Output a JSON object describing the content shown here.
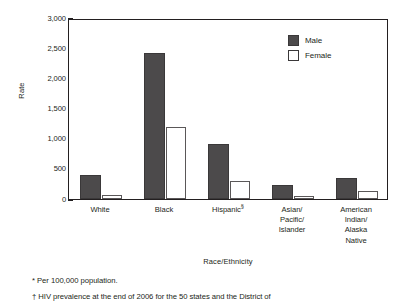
{
  "chart_data": {
    "type": "bar",
    "title": "",
    "xlabel": "Race/Ethnicity",
    "ylabel": "Rate",
    "ylim": [
      0,
      3000
    ],
    "ytick_labels": [
      "3,000",
      "2,500",
      "2,000",
      "1,500",
      "1,000",
      "500",
      "0"
    ],
    "ytick_values": [
      3000,
      2500,
      2000,
      1500,
      1000,
      500,
      0
    ],
    "grid": false,
    "legend_position": "top-right",
    "categories": [
      "White",
      "Black",
      "Hispanic§",
      "Asian/\nPacific/\nIslander",
      "American\nIndian/\nAlaska\nNative"
    ],
    "category_labels": [
      {
        "lines": [
          "White"
        ],
        "sup": ""
      },
      {
        "lines": [
          "Black"
        ],
        "sup": ""
      },
      {
        "lines": [
          "Hispanic"
        ],
        "sup": "§"
      },
      {
        "lines": [
          "Asian/",
          "Pacific/",
          "Islander"
        ],
        "sup": ""
      },
      {
        "lines": [
          "American",
          "Indian/",
          "Alaska",
          "Native"
        ],
        "sup": ""
      }
    ],
    "series": [
      {
        "name": "Male",
        "color": "#4c4a4b",
        "values": [
          400,
          2420,
          910,
          230,
          350
        ]
      },
      {
        "name": "Female",
        "color": "#ffffff",
        "values": [
          70,
          1190,
          300,
          50,
          130
        ]
      }
    ]
  },
  "legend": {
    "items": [
      {
        "label": "Male",
        "style": "male"
      },
      {
        "label": "Female",
        "style": "female"
      }
    ]
  },
  "footnotes": [
    "* Per 100,000 population.",
    "† HIV prevalence at the end of 2006 for the 50 states and the District of"
  ],
  "colors": {
    "male_fill": "#4c4a4b",
    "female_fill": "#ffffff",
    "axis": "#231f20",
    "text": "#231f20",
    "background": "#ffffff"
  }
}
